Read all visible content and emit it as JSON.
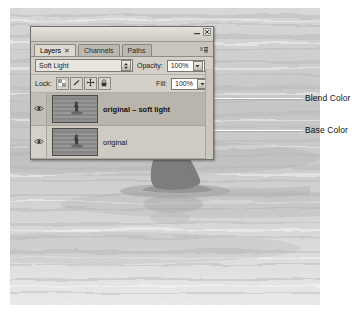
{
  "photo": {
    "description": "black and white photograph of a surfer sitting on a surfboard in the ocean",
    "alt": "surfer-on-water"
  },
  "panel": {
    "title": "Layers",
    "tabs": [
      {
        "label": "Layers",
        "active": true,
        "close": "✕"
      },
      {
        "label": "Channels",
        "active": false
      },
      {
        "label": "Paths",
        "active": false
      }
    ],
    "window_controls": {
      "minimize": "minimize-icon",
      "close": "close-icon",
      "menu": "panel-menu-icon"
    },
    "blend_mode": {
      "label": "",
      "value": "Soft Light",
      "options": [
        "Normal",
        "Dissolve",
        "Darken",
        "Multiply",
        "Color Burn",
        "Linear Burn",
        "Lighten",
        "Screen",
        "Color Dodge",
        "Linear Dodge",
        "Overlay",
        "Soft Light",
        "Hard Light",
        "Vivid Light",
        "Linear Light",
        "Pin Light",
        "Hard Mix",
        "Difference",
        "Exclusion",
        "Hue",
        "Saturation",
        "Color",
        "Luminosity"
      ]
    },
    "opacity": {
      "label": "Opacity:",
      "value": "100%"
    },
    "fill": {
      "label": "Fill:",
      "value": "100%"
    },
    "lock": {
      "label": "Lock:",
      "buttons": [
        {
          "name": "lock-transparent-pixels",
          "icon": "checkerboard-icon",
          "pressed": false
        },
        {
          "name": "lock-image-pixels",
          "icon": "brush-icon",
          "pressed": false
        },
        {
          "name": "lock-position",
          "icon": "move-cross-icon",
          "pressed": false
        },
        {
          "name": "lock-all",
          "icon": "padlock-icon",
          "pressed": false
        }
      ]
    },
    "layers": [
      {
        "name": "original – soft light",
        "visible": true,
        "selected": true
      },
      {
        "name": "original",
        "visible": true,
        "selected": false
      }
    ]
  },
  "annotations": [
    {
      "label": "Blend Color",
      "target": "layer-row-0"
    },
    {
      "label": "Base Color",
      "target": "layer-row-1"
    }
  ],
  "colors": {
    "panel_face": "#d4d0c8",
    "panel_border": "#6f6f6f",
    "row_selected": "#b9b5ad",
    "leader_line": "#ffffff",
    "annotation_text": "#111111"
  }
}
